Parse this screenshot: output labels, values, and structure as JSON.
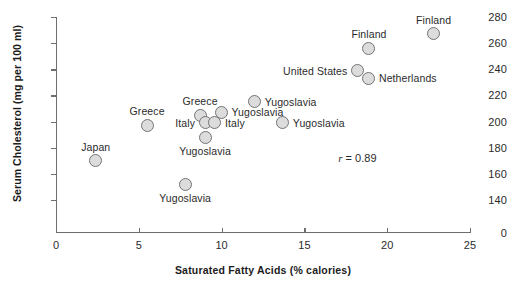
{
  "chart_data": {
    "type": "scatter",
    "title": "",
    "xlabel": "Saturated Fatty Acids (% calories)",
    "ylabel": "Serum Cholesterol (mg per 100 ml)",
    "xlim": [
      0,
      25
    ],
    "ylim": [
      140,
      280
    ],
    "y_axis_break": true,
    "y_origin_label": "0",
    "grid": false,
    "legend": false,
    "xticks": [
      "0",
      "5",
      "10",
      "15",
      "20",
      "25"
    ],
    "xtick_values": [
      0,
      5,
      10,
      15,
      20,
      25
    ],
    "yticks": [
      "140",
      "160",
      "180",
      "200",
      "220",
      "240",
      "260",
      "280"
    ],
    "ytick_values": [
      140,
      160,
      180,
      200,
      220,
      240,
      260,
      280
    ],
    "annotations": [
      {
        "name": "correlation",
        "symbol": "r",
        "text": " = 0.89",
        "full_text": "r = 0.89",
        "x": 18.2,
        "y": 172
      }
    ],
    "points": [
      {
        "label": "Japan",
        "x": 2.4,
        "y": 170,
        "label_pos": "above"
      },
      {
        "label": "Greece",
        "x": 5.5,
        "y": 197,
        "label_pos": "above"
      },
      {
        "label": "Yugoslavia",
        "x": 7.8,
        "y": 152,
        "label_pos": "below"
      },
      {
        "label": "Greece",
        "x": 8.7,
        "y": 205,
        "label_pos": "above"
      },
      {
        "label": "Yugoslavia",
        "x": 9.0,
        "y": 188,
        "label_pos": "below"
      },
      {
        "label": "Italy",
        "x": 9.0,
        "y": 199,
        "label_pos": "left"
      },
      {
        "label": "Italy",
        "x": 9.6,
        "y": 199,
        "label_pos": "right"
      },
      {
        "label": "Yugoslavia",
        "x": 10.0,
        "y": 207,
        "label_pos": "right"
      },
      {
        "label": "Yugoslavia",
        "x": 12.0,
        "y": 215,
        "label_pos": "right"
      },
      {
        "label": "Yugoslavia",
        "x": 13.7,
        "y": 199,
        "label_pos": "right"
      },
      {
        "label": "United States",
        "x": 18.2,
        "y": 239,
        "label_pos": "left"
      },
      {
        "label": "Netherlands",
        "x": 18.9,
        "y": 233,
        "label_pos": "right"
      },
      {
        "label": "Finland",
        "x": 18.9,
        "y": 256,
        "label_pos": "above"
      },
      {
        "label": "Finland",
        "x": 22.8,
        "y": 267,
        "label_pos": "above"
      }
    ],
    "colors": {
      "marker_fill": "#dcdcdc",
      "marker_edge": "#737373",
      "axis": "#6e6e6e",
      "text": "#2b2b2b",
      "axis_title": "#1c1c1c",
      "background": "#ffffff"
    }
  }
}
